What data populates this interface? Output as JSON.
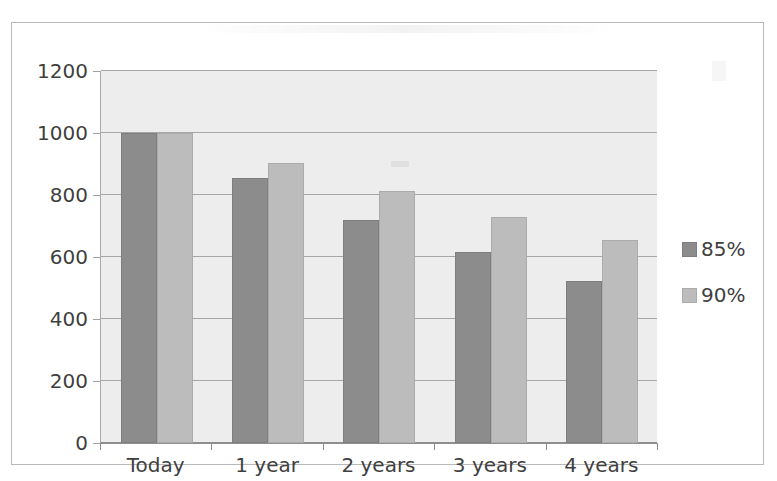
{
  "chart_data": {
    "type": "bar",
    "title": "",
    "xlabel": "",
    "ylabel": "",
    "categories": [
      "Today",
      "1 year",
      "2 years",
      "3 years",
      "4 years"
    ],
    "series": [
      {
        "name": "85%",
        "color": "#8c8c8c",
        "values": [
          1000,
          855,
          720,
          615,
          523
        ]
      },
      {
        "name": "90%",
        "color": "#bcbcbc",
        "values": [
          1000,
          902,
          812,
          730,
          655
        ]
      }
    ],
    "ylim": [
      0,
      1200
    ],
    "yticks": [
      0,
      200,
      400,
      600,
      800,
      1000,
      1200
    ],
    "ytick_labels": [
      "0",
      "200",
      "400",
      "600",
      "800",
      "1000",
      "1200"
    ],
    "grid": true,
    "legend_position": "right",
    "plot_background": "#ededed",
    "gridline_color": "#a6a6a6",
    "axis_color": "#8f8f8f",
    "frame_border_color": "#b9b9b9"
  },
  "legend": {
    "items": [
      {
        "label": "85%"
      },
      {
        "label": "90%"
      }
    ]
  }
}
